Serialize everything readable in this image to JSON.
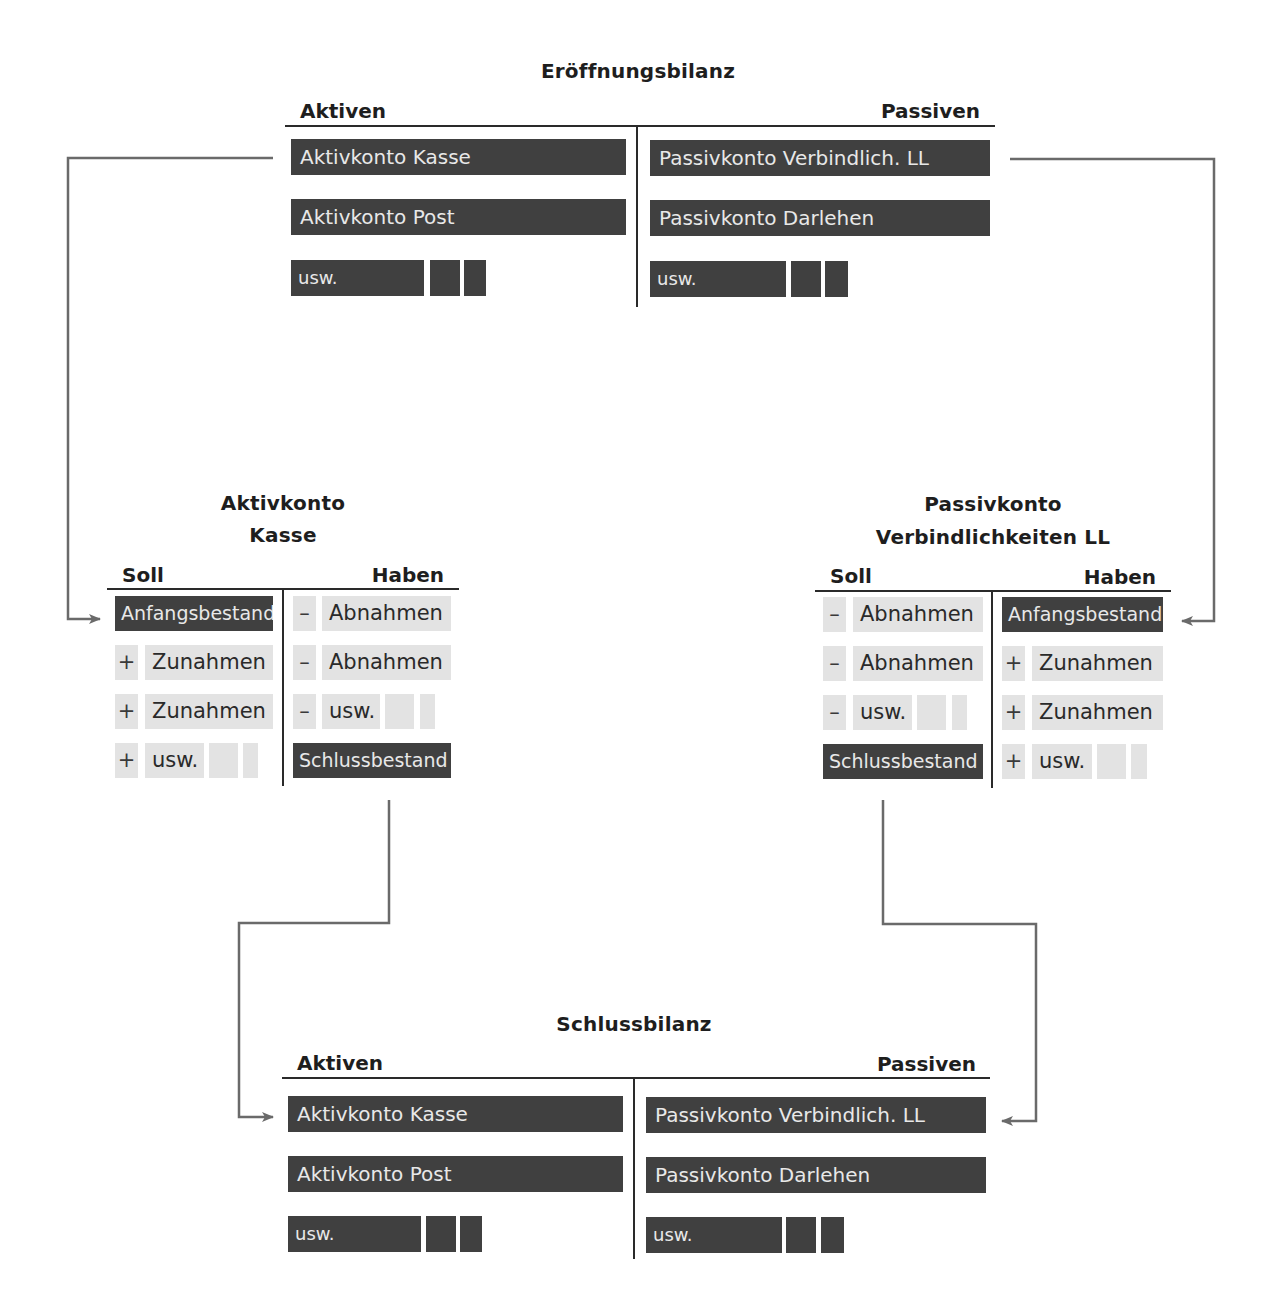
{
  "opening_balance": {
    "title": "Eröffnungsbilanz",
    "assets_header": "Aktiven",
    "liabilities_header": "Passiven",
    "assets": [
      "Aktivkonto Kasse",
      "Aktivkonto Post",
      "usw."
    ],
    "liabilities": [
      "Passivkonto Verbindlich. LL",
      "Passivkonto Darlehen",
      "usw."
    ]
  },
  "asset_account": {
    "title_line1": "Aktivkonto",
    "title_line2": "Kasse",
    "debit_header": "Soll",
    "credit_header": "Haben",
    "debit": {
      "opening": "Anfangsbestand",
      "rows": [
        {
          "sign": "+",
          "label": "Zunahmen"
        },
        {
          "sign": "+",
          "label": "Zunahmen"
        },
        {
          "sign": "+",
          "label": "usw."
        }
      ]
    },
    "credit": {
      "rows": [
        {
          "sign": "–",
          "label": "Abnahmen"
        },
        {
          "sign": "–",
          "label": "Abnahmen"
        },
        {
          "sign": "–",
          "label": "usw."
        }
      ],
      "closing": "Schlussbestand"
    }
  },
  "liability_account": {
    "title_line1": "Passivkonto",
    "title_line2": "Verbindlichkeiten LL",
    "debit_header": "Soll",
    "credit_header": "Haben",
    "debit": {
      "rows": [
        {
          "sign": "–",
          "label": "Abnahmen"
        },
        {
          "sign": "–",
          "label": "Abnahmen"
        },
        {
          "sign": "–",
          "label": "usw."
        }
      ],
      "closing": "Schlussbestand"
    },
    "credit": {
      "opening": "Anfangsbestand",
      "rows": [
        {
          "sign": "+",
          "label": "Zunahmen"
        },
        {
          "sign": "+",
          "label": "Zunahmen"
        },
        {
          "sign": "+",
          "label": "usw."
        }
      ]
    }
  },
  "closing_balance": {
    "title": "Schlussbilanz",
    "assets_header": "Aktiven",
    "liabilities_header": "Passiven",
    "assets": [
      "Aktivkonto Kasse",
      "Aktivkonto Post",
      "usw."
    ],
    "liabilities": [
      "Passivkonto Verbindlich. LL",
      "Passivkonto Darlehen",
      "usw."
    ]
  },
  "colors": {
    "dark_box": "#404040",
    "light_box": "#e3e3e3",
    "connector": "#6a6a6a",
    "rule": "#2a2a2a"
  }
}
